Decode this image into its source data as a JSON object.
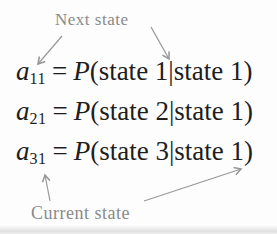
{
  "labels": {
    "next_state": "Next state",
    "current_state": "Current state"
  },
  "equations": [
    {
      "var": "a",
      "sub": "11",
      "equals": "=",
      "func": "P",
      "args": "(state 1|state 1)"
    },
    {
      "var": "a",
      "sub": "21",
      "equals": "=",
      "func": "P",
      "args": "(state 2|state 1)"
    },
    {
      "var": "a",
      "sub": "31",
      "equals": "=",
      "func": "P",
      "args": "(state 3|state 1)"
    }
  ],
  "colors": {
    "background": "#fdfdfd",
    "text": "#1e1e1e",
    "label": "#8a8a8a",
    "arrow": "#989898"
  }
}
